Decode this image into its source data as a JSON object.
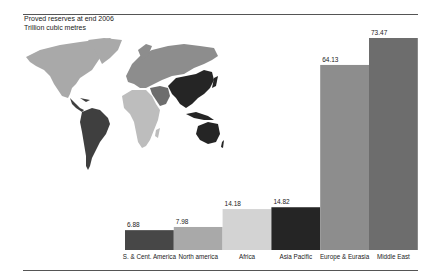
{
  "header": {
    "title": "Proved reserves at end 2006",
    "subtitle": "Trillion cubic metres"
  },
  "chart_data": {
    "type": "bar",
    "title": "Proved reserves at end 2006",
    "subtitle": "Trillion cubic metres",
    "xlabel": "",
    "ylabel": "Trillion cubic metres",
    "categories": [
      "S. & Cent. America",
      "North america",
      "Africa",
      "Asia Pacific",
      "Europe & Eurasia",
      "Middle East"
    ],
    "values": [
      6.88,
      7.98,
      14.18,
      14.82,
      64.13,
      73.47
    ],
    "value_labels": [
      "6.88",
      "7.98",
      "14.18",
      "14.82",
      "64.13",
      "73.47"
    ],
    "colors": [
      "#474747",
      "#a9a9a9",
      "#d3d3d3",
      "#252525",
      "#8d8d8d",
      "#6d6d6d"
    ],
    "ylim": [
      0,
      73.47
    ],
    "grid": false,
    "legend": "none",
    "inset": "world map shaded by region, matching bar colors"
  },
  "map": {
    "region_colors": {
      "north_america": "#a9a9a9",
      "south_central_america": "#3f3f3f",
      "europe_eurasia": "#8d8d8d",
      "middle_east": "#6d6d6d",
      "africa": "#bdbdbd",
      "asia_pacific": "#252525"
    }
  }
}
